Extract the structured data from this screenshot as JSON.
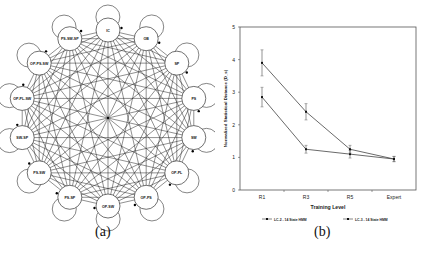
{
  "figure_a": {
    "caption": "(a)",
    "center": [
      108,
      118
    ],
    "ring_radius": 88,
    "node_radius": 12,
    "nodes": [
      {
        "label": "IC"
      },
      {
        "label": "OB"
      },
      {
        "label": "SP"
      },
      {
        "label": "PS"
      },
      {
        "label": "SW"
      },
      {
        "label": "OP-PL"
      },
      {
        "label": "OP-PS"
      },
      {
        "label": "OP-SW"
      },
      {
        "label": "PS-SP"
      },
      {
        "label": "PS-SW"
      },
      {
        "label": "SW-SP"
      },
      {
        "label": "OP-PL-SW"
      },
      {
        "label": "OP-PS-SW"
      },
      {
        "label": "PS-SW-SP"
      }
    ]
  },
  "figure_b": {
    "caption": "(b)"
  },
  "chart_data": {
    "type": "line",
    "title": "",
    "xlabel": "Training Level",
    "ylabel": "Normalized Statistical Distance (D_s)",
    "categories": [
      "R1",
      "R3",
      "R5",
      "Expert"
    ],
    "ylim": [
      0,
      5
    ],
    "yticks": [
      0,
      1,
      2,
      3,
      4,
      5
    ],
    "grid": false,
    "legend_position": "bottom",
    "series": [
      {
        "name": "LC-2 - 14 State HMM",
        "values": [
          2.85,
          1.25,
          1.1,
          0.95
        ],
        "errors": [
          0.3,
          0.12,
          0.12,
          0.08
        ],
        "marker": "tick"
      },
      {
        "name": "LC-3 - 14 State HMM",
        "values": [
          3.9,
          2.4,
          1.25,
          0.95
        ],
        "errors": [
          0.4,
          0.25,
          0.12,
          0.08
        ],
        "marker": "square"
      }
    ]
  }
}
